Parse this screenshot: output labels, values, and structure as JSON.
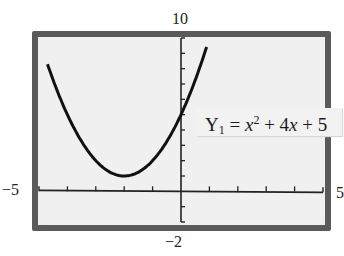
{
  "window": {
    "ymax_label": "10",
    "ymin_label": "−2",
    "xmin_label": "−5",
    "xmax_label": "5"
  },
  "equation": {
    "lhs": "Y",
    "subscript": "1",
    "rhs_prefix": " = ",
    "var": "x",
    "exp": "2",
    "rest_a": " + 4",
    "var2": "x",
    "rest_b": " + 5"
  },
  "colors": {
    "frame": "#5a5a5a",
    "screen": "#f0f0f0",
    "curve": "#111111",
    "axes": "#222222"
  },
  "chart_data": {
    "type": "line",
    "title": "",
    "function": "Y1 = x^2 + 4x + 5",
    "xlabel": "",
    "ylabel": "",
    "xlim": [
      -5,
      5
    ],
    "ylim": [
      -2,
      10
    ],
    "xscale": 1,
    "yscale": 1,
    "grid": false,
    "x_ticks": [
      -4,
      -3,
      -2,
      -1,
      1,
      2,
      3,
      4
    ],
    "y_ticks": [
      -1,
      1,
      2,
      3,
      4,
      5,
      6,
      7,
      8,
      9
    ],
    "vertex": [
      -2,
      1
    ],
    "series": [
      {
        "name": "Y1",
        "x": [
          -4.7,
          -4.5,
          -4,
          -3.5,
          -3,
          -2.5,
          -2,
          -1.5,
          -1,
          -0.5,
          0,
          0.5,
          0.9
        ],
        "values": [
          8.29,
          7.25,
          5,
          3.25,
          2,
          1.25,
          1,
          1.25,
          2,
          3.25,
          5,
          7.25,
          9.41
        ]
      }
    ],
    "annotations": [
      "Y1 = x² + 4x + 5"
    ]
  }
}
